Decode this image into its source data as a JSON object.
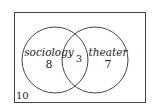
{
  "venn": {
    "universe_count": "10",
    "sets": [
      {
        "label": "sociology",
        "count": "8"
      },
      {
        "label": "theater",
        "count": "7"
      }
    ],
    "intersection_count": "3"
  }
}
